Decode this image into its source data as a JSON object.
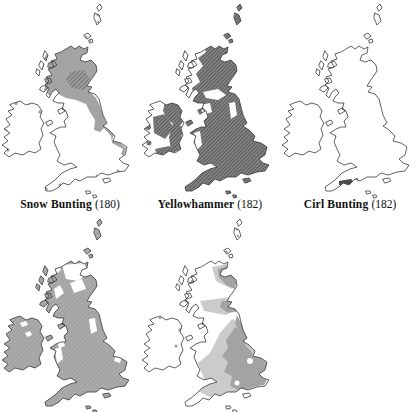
{
  "colors": {
    "page_bg": "#ffffff",
    "outline": "#3a3a3a",
    "shade_gray": "#a3a3a3",
    "shade_light": "#cbcbcb",
    "hatch_dark": "#565656",
    "hatch_gap": "#9e9e9e",
    "dark_fill": "#4a4a4a",
    "label_text": "#111111"
  },
  "figure": {
    "maps": [
      {
        "name": "Snow Bunting",
        "count": "(180)",
        "shading": "grey fill over Scotland, NE England and scattered coastal dots; darker hatched core in central Highlands"
      },
      {
        "name": "Yellowhammer",
        "count": "(182)",
        "shading": "dense dark diagonal hatching over most of Britain and eastern Ireland; NW Scottish Highlands and islands unshaded"
      },
      {
        "name": "Cirl Bunting",
        "count": "(182)",
        "shading": "outline only, small dark patch on the south Devon coast"
      },
      {
        "name": "",
        "count": "",
        "shading": "grey fill over nearly all of Britain and Ireland with white gaps in the Highlands, Pennines and mid-Wales (caption cut off at page edge)"
      },
      {
        "name": "",
        "count": "",
        "shading": "grey fill over eastern Scotland and eastern/central England with paler grey fringe; Ireland nearly unshaded (caption cut off at page edge)"
      }
    ]
  }
}
